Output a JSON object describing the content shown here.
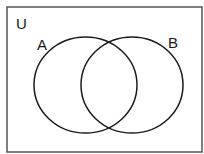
{
  "diagram": {
    "type": "venn",
    "universe_label": "U",
    "sets": [
      {
        "label": "A"
      },
      {
        "label": "B"
      }
    ],
    "colors": {
      "stroke": "#1a1a1a",
      "background": "#ffffff"
    }
  }
}
